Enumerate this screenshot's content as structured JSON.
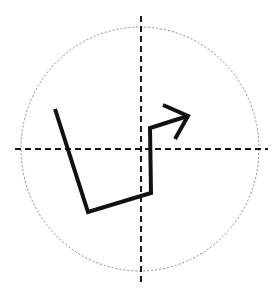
{
  "diagram": {
    "background": "#ffffff",
    "circle": {
      "cx": 140,
      "cy": 149,
      "rx": 119,
      "ry": 122,
      "stroke": "#888888",
      "dash": "2,2",
      "width": 1
    },
    "axes": {
      "horizontal": {
        "x1": 15,
        "y1": 149,
        "x2": 268,
        "y2": 149
      },
      "vertical": {
        "x1": 141,
        "y1": 16,
        "x2": 141,
        "y2": 284
      },
      "stroke": "#1a1a1a",
      "dash": "6,4",
      "width": 2
    },
    "path": {
      "points": "55,109 88,212 151,193 150,128 188,116",
      "stroke": "#111111",
      "width": 4
    },
    "arrowhead": {
      "points": "163,105 188,116 175,139",
      "stroke": "#111111",
      "width": 4
    }
  }
}
